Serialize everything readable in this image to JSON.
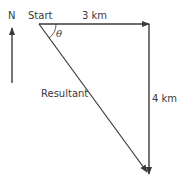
{
  "diagram": {
    "north_label": "N",
    "start_label": "Start",
    "east_vector_label": "3 km",
    "south_vector_label": "4 km",
    "resultant_label": "Resultant",
    "angle_label": "θ",
    "colors": {
      "line": "#3a3a3a",
      "text": "#3a3a3a",
      "background": "#ffffff"
    }
  }
}
